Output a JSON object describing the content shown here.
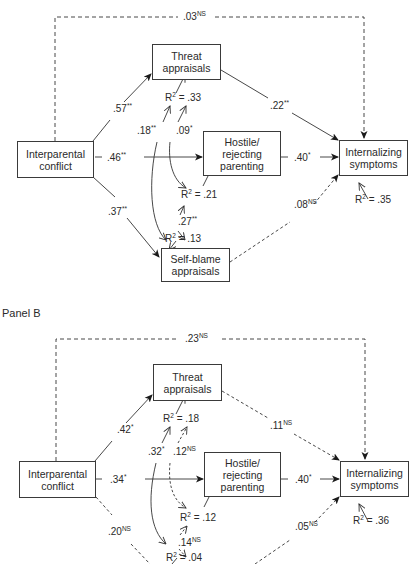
{
  "panel_b_title": "Panel B",
  "panels": {
    "A": {
      "nodes": {
        "interparental": "Interparental conflict",
        "threat": "Threat appraisals",
        "hostile": "Hostile/ rejecting parenting",
        "selfblame": "Self-blame appraisals",
        "internalizing": "Internalizing symptoms"
      },
      "paths": {
        "direct": {
          "value": ".03",
          "sig": "NS"
        },
        "ipc_threat": {
          "value": ".57",
          "sig": "**"
        },
        "ipc_hostile": {
          "value": ".46",
          "sig": "**"
        },
        "ipc_selfblame": {
          "value": ".37",
          "sig": "**"
        },
        "threat_int": {
          "value": ".22",
          "sig": "**"
        },
        "hostile_int": {
          "value": ".40",
          "sig": "*"
        },
        "selfblame_int": {
          "value": ".08",
          "sig": "NS"
        },
        "cov_18": {
          "value": ".18",
          "sig": "**"
        },
        "cov_09": {
          "value": ".09",
          "sig": "*"
        },
        "cov_27": {
          "value": ".27",
          "sig": "**"
        }
      },
      "r2": {
        "threat": "= .33",
        "hostile": "= .21",
        "selfblame": "= .13",
        "internalizing": "= .35"
      }
    },
    "B": {
      "nodes": {
        "interparental": "Interparental conflict",
        "threat": "Threat appraisals",
        "hostile": "Hostile/ rejecting parenting",
        "selfblame": "Self-blame appraisals",
        "internalizing": "Internalizing symptoms"
      },
      "paths": {
        "direct": {
          "value": ".23",
          "sig": "NS"
        },
        "ipc_threat": {
          "value": ".42",
          "sig": "*"
        },
        "ipc_hostile": {
          "value": ".34",
          "sig": "*"
        },
        "ipc_selfblame": {
          "value": ".20",
          "sig": "NS"
        },
        "threat_int": {
          "value": ".11",
          "sig": "NS"
        },
        "hostile_int": {
          "value": ".40",
          "sig": "*"
        },
        "selfblame_int": {
          "value": ".05",
          "sig": "NS"
        },
        "cov_32": {
          "value": ".32",
          "sig": "*"
        },
        "cov_12": {
          "value": ".12",
          "sig": "NS"
        },
        "cov_14": {
          "value": ".14",
          "sig": "NS"
        }
      },
      "r2": {
        "threat": "= .18",
        "hostile": "= .12",
        "selfblame": "= .04",
        "internalizing": "= .36"
      }
    }
  }
}
